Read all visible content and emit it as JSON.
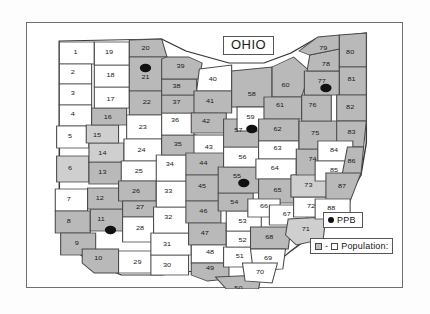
{
  "figure": {
    "title": "OHIO",
    "state": "Ohio"
  },
  "legend": {
    "ppb": {
      "label": "PPB",
      "marker": "filled-circle",
      "color": "#111111"
    },
    "population": {
      "label": "Population:",
      "dash": "-",
      "high_swatch_color": "#bdbdbd",
      "low_swatch_color": "#ffffff"
    }
  },
  "chart_data": {
    "type": "map",
    "title": "OHIO",
    "counties": [
      {
        "id": 1,
        "x": 36,
        "y": 30,
        "shade": "white"
      },
      {
        "id": 2,
        "x": 34,
        "y": 50,
        "shade": "white"
      },
      {
        "id": 3,
        "x": 34,
        "y": 71,
        "shade": "white"
      },
      {
        "id": 4,
        "x": 34,
        "y": 92,
        "shade": "white"
      },
      {
        "id": 5,
        "x": 32,
        "y": 114,
        "shade": "white"
      },
      {
        "id": 6,
        "x": 32,
        "y": 146,
        "shade": "gray2"
      },
      {
        "id": 7,
        "x": 31,
        "y": 177,
        "shade": "white"
      },
      {
        "id": 8,
        "x": 31,
        "y": 199,
        "shade": "gray"
      },
      {
        "id": 9,
        "x": 37,
        "y": 221,
        "shade": "gray"
      },
      {
        "id": 10,
        "x": 53,
        "y": 236,
        "shade": "gray"
      },
      {
        "id": 11,
        "x": 55,
        "y": 197,
        "shade": "gray"
      },
      {
        "id": 12,
        "x": 54,
        "y": 176,
        "shade": "gray"
      },
      {
        "id": 13,
        "x": 56,
        "y": 150,
        "shade": "gray"
      },
      {
        "id": 14,
        "x": 56,
        "y": 131,
        "shade": "gray2"
      },
      {
        "id": 15,
        "x": 52,
        "y": 113,
        "shade": "gray2"
      },
      {
        "id": 16,
        "x": 60,
        "y": 95,
        "shade": "gray"
      },
      {
        "id": 17,
        "x": 62,
        "y": 77,
        "shade": "white"
      },
      {
        "id": 18,
        "x": 62,
        "y": 53,
        "shade": "white"
      },
      {
        "id": 19,
        "x": 61,
        "y": 30,
        "shade": "white"
      },
      {
        "id": 20,
        "x": 88,
        "y": 26,
        "shade": "gray"
      },
      {
        "id": 21,
        "x": 88,
        "y": 55,
        "shade": "gray"
      },
      {
        "id": 22,
        "x": 89,
        "y": 80,
        "shade": "gray"
      },
      {
        "id": 23,
        "x": 86,
        "y": 105,
        "shade": "white"
      },
      {
        "id": 24,
        "x": 85,
        "y": 128,
        "shade": "white"
      },
      {
        "id": 25,
        "x": 83,
        "y": 149,
        "shade": "white"
      },
      {
        "id": 26,
        "x": 81,
        "y": 169,
        "shade": "gray"
      },
      {
        "id": 27,
        "x": 84,
        "y": 185,
        "shade": "gray"
      },
      {
        "id": 28,
        "x": 84,
        "y": 206,
        "shade": "white"
      },
      {
        "id": 29,
        "x": 82,
        "y": 240,
        "shade": "white"
      },
      {
        "id": 30,
        "x": 104,
        "y": 243,
        "shade": "white"
      },
      {
        "id": 31,
        "x": 104,
        "y": 222,
        "shade": "white"
      },
      {
        "id": 32,
        "x": 105,
        "y": 195,
        "shade": "white"
      },
      {
        "id": 33,
        "x": 105,
        "y": 169,
        "shade": "white"
      },
      {
        "id": 34,
        "x": 106,
        "y": 142,
        "shade": "white"
      },
      {
        "id": 35,
        "x": 112,
        "y": 122,
        "shade": "gray"
      },
      {
        "id": 36,
        "x": 110,
        "y": 98,
        "shade": "white"
      },
      {
        "id": 37,
        "x": 111,
        "y": 80,
        "shade": "gray"
      },
      {
        "id": 38,
        "x": 111,
        "y": 64,
        "shade": "gray"
      },
      {
        "id": 39,
        "x": 114,
        "y": 44,
        "shade": "gray"
      },
      {
        "id": 40,
        "x": 138,
        "y": 57,
        "shade": "white"
      },
      {
        "id": 41,
        "x": 136,
        "y": 79,
        "shade": "gray"
      },
      {
        "id": 42,
        "x": 133,
        "y": 99,
        "shade": "gray"
      },
      {
        "id": 43,
        "x": 135,
        "y": 125,
        "shade": "white"
      },
      {
        "id": 44,
        "x": 131,
        "y": 141,
        "shade": "gray"
      },
      {
        "id": 45,
        "x": 130,
        "y": 164,
        "shade": "gray"
      },
      {
        "id": 46,
        "x": 131,
        "y": 189,
        "shade": "gray"
      },
      {
        "id": 47,
        "x": 132,
        "y": 211,
        "shade": "gray"
      },
      {
        "id": 48,
        "x": 136,
        "y": 230,
        "shade": "white"
      },
      {
        "id": 49,
        "x": 136,
        "y": 246,
        "shade": "gray"
      },
      {
        "id": 50,
        "x": 157,
        "y": 266,
        "shade": "gray"
      },
      {
        "id": 51,
        "x": 158,
        "y": 234,
        "shade": "white"
      },
      {
        "id": 52,
        "x": 160,
        "y": 218,
        "shade": "white"
      },
      {
        "id": 53,
        "x": 160,
        "y": 199,
        "shade": "white"
      },
      {
        "id": 54,
        "x": 154,
        "y": 180,
        "shade": "gray"
      },
      {
        "id": 55,
        "x": 156,
        "y": 154,
        "shade": "gray"
      },
      {
        "id": 56,
        "x": 160,
        "y": 135,
        "shade": "white"
      },
      {
        "id": 57,
        "x": 157,
        "y": 108,
        "shade": "gray"
      },
      {
        "id": 58,
        "x": 167,
        "y": 72,
        "shade": "gray"
      },
      {
        "id": 59,
        "x": 166,
        "y": 95,
        "shade": "white"
      },
      {
        "id": 60,
        "x": 192,
        "y": 63,
        "shade": "gray"
      },
      {
        "id": 61,
        "x": 188,
        "y": 83,
        "shade": "gray"
      },
      {
        "id": 62,
        "x": 186,
        "y": 107,
        "shade": "gray"
      },
      {
        "id": 63,
        "x": 186,
        "y": 126,
        "shade": "white"
      },
      {
        "id": 64,
        "x": 184,
        "y": 146,
        "shade": "white"
      },
      {
        "id": 65,
        "x": 186,
        "y": 168,
        "shade": "gray"
      },
      {
        "id": 66,
        "x": 176,
        "y": 184,
        "shade": "white"
      },
      {
        "id": 67,
        "x": 193,
        "y": 192,
        "shade": "white"
      },
      {
        "id": 68,
        "x": 180,
        "y": 215,
        "shade": "gray"
      },
      {
        "id": 69,
        "x": 179,
        "y": 236,
        "shade": "white"
      },
      {
        "id": 70,
        "x": 173,
        "y": 250,
        "shade": "white"
      },
      {
        "id": 71,
        "x": 207,
        "y": 207,
        "shade": "gray2"
      },
      {
        "id": 72,
        "x": 211,
        "y": 184,
        "shade": "white"
      },
      {
        "id": 73,
        "x": 209,
        "y": 163,
        "shade": "gray2"
      },
      {
        "id": 74,
        "x": 212,
        "y": 137,
        "shade": "gray"
      },
      {
        "id": 75,
        "x": 214,
        "y": 111,
        "shade": "gray"
      },
      {
        "id": 76,
        "x": 212,
        "y": 83,
        "shade": "gray"
      },
      {
        "id": 77,
        "x": 219,
        "y": 59,
        "shade": "gray"
      },
      {
        "id": 78,
        "x": 222,
        "y": 42,
        "shade": "gray"
      },
      {
        "id": 79,
        "x": 220,
        "y": 26,
        "shade": "gray"
      },
      {
        "id": 80,
        "x": 240,
        "y": 30,
        "shade": "gray"
      },
      {
        "id": 81,
        "x": 241,
        "y": 57,
        "shade": "gray"
      },
      {
        "id": 82,
        "x": 240,
        "y": 85,
        "shade": "gray"
      },
      {
        "id": 83,
        "x": 241,
        "y": 110,
        "shade": "gray"
      },
      {
        "id": 84,
        "x": 228,
        "y": 128,
        "shade": "white"
      },
      {
        "id": 85,
        "x": 228,
        "y": 148,
        "shade": "white"
      },
      {
        "id": 86,
        "x": 241,
        "y": 139,
        "shade": "gray"
      },
      {
        "id": 87,
        "x": 234,
        "y": 164,
        "shade": "gray"
      },
      {
        "id": 88,
        "x": 226,
        "y": 186,
        "shade": "white"
      }
    ],
    "ppb_sites": [
      {
        "county": 21,
        "x": 88,
        "y": 45
      },
      {
        "county": 77,
        "x": 222,
        "y": 65
      },
      {
        "county": 59,
        "x": 167,
        "y": 106
      },
      {
        "county": 55,
        "x": 161,
        "y": 160
      },
      {
        "county": 11,
        "x": 62,
        "y": 207
      }
    ],
    "shading_legend": {
      "gray": "higher population",
      "white": "lower population"
    }
  }
}
